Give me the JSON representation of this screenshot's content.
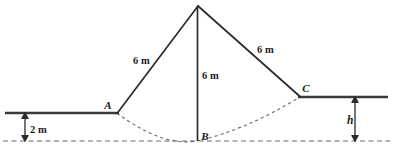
{
  "figure": {
    "colors": {
      "line": "#2b2b2b",
      "ground": "#3a3a3a",
      "dashed": "#6b6b6b",
      "background": "#ffffff",
      "text": "#1a1a1a"
    },
    "points": [
      {
        "id": "A",
        "label": "A",
        "x": 117,
        "y": 113,
        "label_x": 110,
        "label_y": 108
      },
      {
        "id": "B",
        "label": "B",
        "x": 197,
        "y": 141,
        "label_x": 202,
        "label_y": 140
      },
      {
        "id": "C",
        "label": "C",
        "x": 300,
        "y": 97,
        "label_x": 303,
        "label_y": 92
      },
      {
        "id": "apex",
        "label": "",
        "x": 198,
        "y": 6,
        "label_x": 0,
        "label_y": 0
      }
    ],
    "dimensions": [
      {
        "id": "left-side",
        "label": "6 m",
        "x": 133,
        "y": 64
      },
      {
        "id": "altitude",
        "label": "6 m",
        "x": 202,
        "y": 79
      },
      {
        "id": "right-side",
        "label": "6 m",
        "x": 257,
        "y": 53
      },
      {
        "id": "left-depth",
        "label": "2 m",
        "x": 30,
        "y": 133
      },
      {
        "id": "right-depth",
        "label": "h",
        "x": 347,
        "y": 124
      }
    ],
    "geometry": {
      "apex": {
        "x": 198,
        "y": 6
      },
      "left_leg": "M117,113 L198,6",
      "right_leg": "M198,6 L300,97",
      "altitude": "M198,6 L197,141",
      "left_ground": "M5,113 L118,113",
      "right_ground": "M299,97 L388,97",
      "baseline": "M3,141 L390,141",
      "scour_curve": "M117,113 Q164,147 197,140.5 Q243,131 300,97",
      "left_dim_arrow_x": 25,
      "left_dim_top_y": 113,
      "left_dim_bottom_y": 141,
      "right_dim_arrow_x": 355,
      "right_dim_top_y": 97,
      "right_dim_bottom_y": 141
    }
  }
}
